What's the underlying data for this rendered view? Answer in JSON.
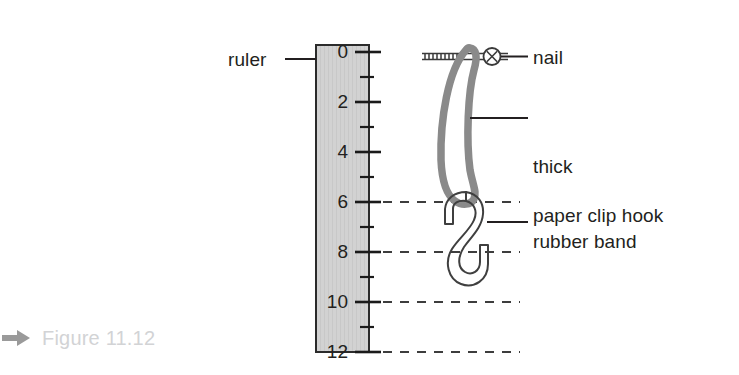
{
  "figure": {
    "caption": "Figure 11.12",
    "caption_arrow_icon": "arrow-right-icon",
    "caption_color": "#d2d3d5"
  },
  "labels": {
    "ruler": "ruler",
    "nail": "nail",
    "rubber_band_line1": "thick",
    "rubber_band_line2": "rubber band",
    "paper_clip_hook": "paper clip hook"
  },
  "ruler": {
    "name": "ruler",
    "fill_color": "#d0d0d0",
    "border_color": "#000000",
    "unit_label": "cm",
    "major_ticks": [
      {
        "value": "0",
        "y": 52
      },
      {
        "value": "2",
        "y": 102
      },
      {
        "value": "4",
        "y": 152
      },
      {
        "value": "6",
        "y": 202
      },
      {
        "value": "8",
        "y": 252
      },
      {
        "value": "10",
        "y": 302
      },
      {
        "value": "12",
        "y": 352
      }
    ],
    "minor_ticks": [
      {
        "value": "1",
        "y": 77
      },
      {
        "value": "3",
        "y": 127
      },
      {
        "value": "5",
        "y": 177
      },
      {
        "value": "7",
        "y": 227
      },
      {
        "value": "9",
        "y": 277
      },
      {
        "value": "11",
        "y": 327
      }
    ],
    "dashed_guides": [
      "6",
      "8",
      "10",
      "12"
    ],
    "scale_min": "0",
    "scale_max": "12"
  },
  "parts": {
    "nail": {
      "name": "nail",
      "head_icon": "circled-x-icon",
      "color": "#3a3a3a"
    },
    "rubber_band": {
      "name": "thick rubber band",
      "color": "#8a8a8a",
      "top_value": "0",
      "bottom_value": "6"
    },
    "paper_clip_hook": {
      "name": "paper clip hook",
      "color": "#4a4a4a",
      "top_value": "6",
      "bottom_value": "10"
    }
  },
  "colors": {
    "ink": "#231f20",
    "ruler_fill": "#d0d0d0",
    "rubber_band": "#8a8a8a",
    "dashed_line": "#4d4d4d",
    "caption_gray": "#d2d3d5",
    "arrow_gray": "#9a9a9a"
  }
}
